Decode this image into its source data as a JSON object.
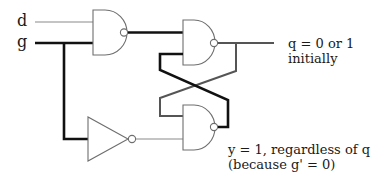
{
  "diagram": {
    "type": "gated D latch (NAND implementation)",
    "inputs": {
      "d_label": "d",
      "g_label": "g"
    },
    "annotations": {
      "q_line1": "q = 0 or 1",
      "q_line2": "initially",
      "y_line1": "y = 1, regardless of q",
      "y_line2": "(because g' = 0)"
    },
    "components": [
      {
        "id": "nand-input",
        "kind": "NAND",
        "inputs": [
          "d",
          "g"
        ]
      },
      {
        "id": "inverter",
        "kind": "NOT",
        "inputs": [
          "g"
        ]
      },
      {
        "id": "nand-q",
        "kind": "NAND",
        "output": "q"
      },
      {
        "id": "nand-y",
        "kind": "NAND",
        "output": "y"
      }
    ],
    "colors": {
      "active_wire": "#111111",
      "inactive_wire": "#8a8a8a",
      "mid_wire": "#555555",
      "gate_outline": "#6e6e6e",
      "text": "#1a1a1a"
    }
  }
}
